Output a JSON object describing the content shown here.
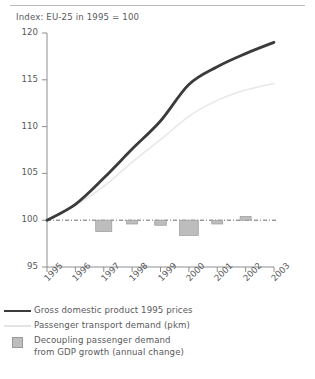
{
  "chart_title": "Index: EU-25 in 1995 = 100",
  "legend": {
    "items": [
      {
        "marker": "solid-line",
        "label": "Gross domestic product 1995 prices"
      },
      {
        "marker": "faint-line",
        "label": "Passenger transport demand (pkm)"
      },
      {
        "marker": "gray-square",
        "label": "Decoupling passenger demand\nfrom GDP growth (annual change)"
      }
    ]
  },
  "chart_data": {
    "type": "line",
    "title": "Index: EU-25 in 1995 = 100",
    "xlabel": "",
    "ylabel": "",
    "ylim": [
      95,
      120
    ],
    "yticks": [
      95,
      100,
      105,
      110,
      115,
      120
    ],
    "grid": false,
    "legend_position": "below",
    "categories": [
      "1995",
      "1996",
      "1997",
      "1998",
      "1999",
      "2000",
      "2001",
      "2002",
      "2003"
    ],
    "x": [
      1995,
      1996,
      1997,
      1998,
      1999,
      2000,
      2001,
      2002,
      2003
    ],
    "reference_line": {
      "value": 100,
      "style": "dash-dot"
    },
    "series": [
      {
        "name": "Gross domestic product 1995 prices",
        "type": "line",
        "color": "#3b3b3d",
        "values": [
          100.0,
          101.7,
          104.5,
          107.6,
          110.6,
          114.5,
          116.4,
          117.8,
          119.0
        ]
      },
      {
        "name": "Passenger transport demand (pkm)",
        "type": "line",
        "color": "#e8e8ea",
        "values": [
          100.0,
          101.6,
          103.6,
          106.2,
          108.6,
          111.1,
          112.8,
          113.9,
          114.6
        ]
      },
      {
        "name": "Decoupling passenger demand from GDP growth (annual change)",
        "type": "bar",
        "color": "#bdbdbd",
        "values": [
          null,
          null,
          -0.9,
          -0.3,
          -0.4,
          -1.2,
          -0.3,
          0.3,
          null
        ]
      }
    ]
  }
}
